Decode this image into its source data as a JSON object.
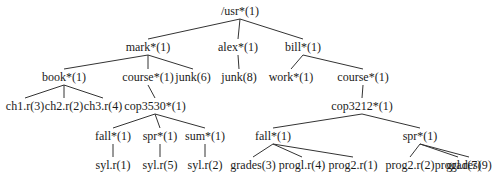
{
  "diagram": {
    "type": "directory-tree",
    "nodes": [
      {
        "id": "usr",
        "label": "/usr*(1)",
        "x": 240,
        "y": 11
      },
      {
        "id": "mark",
        "label": "mark*(1)",
        "x": 148,
        "y": 47
      },
      {
        "id": "alex",
        "label": "alex*(1)",
        "x": 238,
        "y": 47
      },
      {
        "id": "bill",
        "label": "bill*(1)",
        "x": 303,
        "y": 47
      },
      {
        "id": "book",
        "label": "book*(1)",
        "x": 64,
        "y": 77
      },
      {
        "id": "course_mark",
        "label": "course*(1)",
        "x": 148,
        "y": 77
      },
      {
        "id": "junk6",
        "label": "junk(6)",
        "x": 193,
        "y": 77
      },
      {
        "id": "junk8",
        "label": "junk(8)",
        "x": 239,
        "y": 77
      },
      {
        "id": "work",
        "label": "work*(1)",
        "x": 291,
        "y": 77
      },
      {
        "id": "course_bill",
        "label": "course*(1)",
        "x": 363,
        "y": 77
      },
      {
        "id": "ch1",
        "label": "ch1.r(3)",
        "x": 25,
        "y": 106
      },
      {
        "id": "ch2",
        "label": "ch2.r(2)",
        "x": 64,
        "y": 106
      },
      {
        "id": "ch3",
        "label": "ch3.r(4)",
        "x": 103,
        "y": 106
      },
      {
        "id": "cop3530",
        "label": "cop3530*(1)",
        "x": 155,
        "y": 106
      },
      {
        "id": "cop3212",
        "label": "cop3212*(1)",
        "x": 362,
        "y": 106
      },
      {
        "id": "fall_3530",
        "label": "fall*(1)",
        "x": 113,
        "y": 136
      },
      {
        "id": "spr_3530",
        "label": "spr*(1)",
        "x": 160,
        "y": 136
      },
      {
        "id": "sum_3530",
        "label": "sum*(1)",
        "x": 205,
        "y": 136
      },
      {
        "id": "fall_3212",
        "label": "fall*(1)",
        "x": 273,
        "y": 136
      },
      {
        "id": "spr_3212",
        "label": "spr*(1)",
        "x": 420,
        "y": 136
      },
      {
        "id": "syl_fall",
        "label": "syl.r(1)",
        "x": 113,
        "y": 165
      },
      {
        "id": "syl_spr",
        "label": "syl.r(5)",
        "x": 160,
        "y": 165
      },
      {
        "id": "syl_sum",
        "label": "syl.r(2)",
        "x": 205,
        "y": 165
      },
      {
        "id": "grades3",
        "label": "grades(3)",
        "x": 253,
        "y": 165
      },
      {
        "id": "prog1_4",
        "label": "progl.r(4)",
        "x": 302,
        "y": 165
      },
      {
        "id": "prog2_1",
        "label": "prog2.r(1)",
        "x": 353,
        "y": 165
      },
      {
        "id": "prog2_2",
        "label": "prog2.r(2)",
        "x": 410,
        "y": 165
      },
      {
        "id": "prog1_7",
        "label": "progl.r(7)",
        "x": 458,
        "y": 165
      },
      {
        "id": "grades9",
        "label": "grades(9)",
        "x": 500,
        "y": 165
      }
    ],
    "edges": [
      [
        "usr",
        "mark"
      ],
      [
        "usr",
        "alex"
      ],
      [
        "usr",
        "bill"
      ],
      [
        "mark",
        "book"
      ],
      [
        "mark",
        "course_mark"
      ],
      [
        "mark",
        "junk6"
      ],
      [
        "alex",
        "junk8"
      ],
      [
        "bill",
        "work"
      ],
      [
        "bill",
        "course_bill"
      ],
      [
        "book",
        "ch1"
      ],
      [
        "book",
        "ch2"
      ],
      [
        "book",
        "ch3"
      ],
      [
        "course_mark",
        "cop3530"
      ],
      [
        "course_bill",
        "cop3212"
      ],
      [
        "cop3530",
        "fall_3530"
      ],
      [
        "cop3530",
        "spr_3530"
      ],
      [
        "cop3530",
        "sum_3530"
      ],
      [
        "cop3212",
        "fall_3212"
      ],
      [
        "cop3212",
        "spr_3212"
      ],
      [
        "fall_3530",
        "syl_fall"
      ],
      [
        "spr_3530",
        "syl_spr"
      ],
      [
        "sum_3530",
        "syl_sum"
      ],
      [
        "fall_3212",
        "grades3"
      ],
      [
        "fall_3212",
        "prog1_4"
      ],
      [
        "fall_3212",
        "prog2_1"
      ],
      [
        "spr_3212",
        "prog2_2"
      ],
      [
        "spr_3212",
        "prog1_7"
      ],
      [
        "spr_3212",
        "grades9"
      ]
    ],
    "line_color": "#333333",
    "text_color": "#1a1a1a"
  }
}
